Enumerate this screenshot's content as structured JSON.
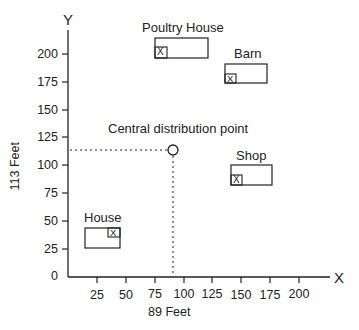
{
  "axes": {
    "x_letter": "X",
    "y_letter": "Y",
    "x_label": "89 Feet",
    "y_label": "113 Feet",
    "x_ticks": [
      "25",
      "50",
      "75",
      "100",
      "125",
      "150",
      "175",
      "200"
    ],
    "y_ticks": [
      "0",
      "25",
      "50",
      "75",
      "100",
      "125",
      "150",
      "175",
      "200"
    ]
  },
  "buildings": [
    {
      "name": "Poultry House",
      "marker": "X"
    },
    {
      "name": "Barn",
      "marker": "X"
    },
    {
      "name": "Shop",
      "marker": "X"
    },
    {
      "name": "House",
      "marker": "X"
    }
  ],
  "central_point": {
    "label": "Central distribution point",
    "x": 89,
    "y": 113
  },
  "colors": {
    "line": "#222222",
    "background": "#ffffff"
  }
}
